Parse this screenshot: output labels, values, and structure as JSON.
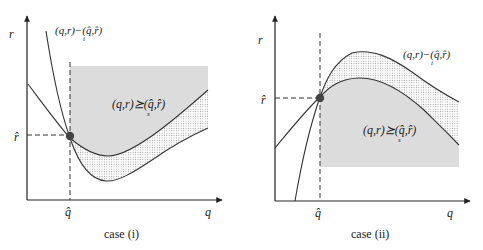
{
  "figure": {
    "panels": [
      {
        "id": "case-i",
        "caption": "case (i)",
        "axis_x_label": "q",
        "axis_y_label": "r",
        "tick_x_label": "q̂",
        "tick_y_label": "r̂",
        "indifference_label": "(q,r)~ᵢ(q̂,r̂)",
        "indifference_main": "(q,r)−(q̂,r̂)",
        "indifference_sub": "i",
        "preference_main": "(q,r)⪰(q̂,r̂)",
        "preference_sub": "s",
        "description": "Investor indifference curve is steeper (U-shaped, lower) than seller's; shaded region above seller curve to right of q̂; dotted region between curves"
      },
      {
        "id": "case-ii",
        "caption": "case (ii)",
        "axis_x_label": "q",
        "axis_y_label": "r",
        "tick_x_label": "q̂",
        "tick_y_label": "r̂",
        "indifference_main": "(q,r)−(q̂,r̂)",
        "indifference_sub": "i",
        "preference_main": "(q,r)⪰(q̂,r̂)",
        "preference_sub": "s",
        "description": "Hump-shaped curves; shaded region below seller curve to right of q̂; dotted region between curves"
      }
    ],
    "colors": {
      "shade": "#dcdcdc",
      "dots": "#9a9a9a",
      "line": "#333333",
      "point": "#444444"
    }
  }
}
